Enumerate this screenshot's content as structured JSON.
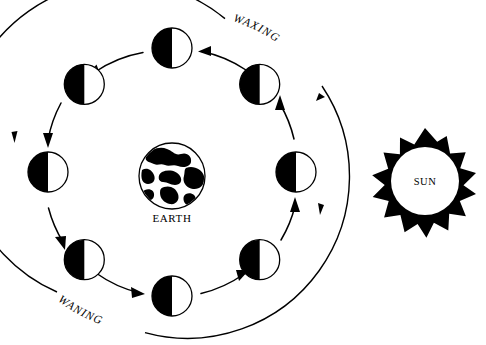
{
  "diagram": {
    "background_color": "#ffffff",
    "ink_color": "#000000",
    "width": 486,
    "height": 345
  },
  "labels": {
    "waxing": "WAXING",
    "waning": "WANING",
    "earth": "EARTH",
    "sun": "SUN"
  },
  "earth": {
    "label": "EARTH",
    "center_x": 172,
    "center_y": 176,
    "radius": 33
  },
  "sun": {
    "label": "SUN",
    "center_x": 425,
    "center_y": 180,
    "core_radius": 33,
    "ray_radius": 52,
    "ray_count": 14
  },
  "orbit": {
    "center_x": 172,
    "center_y": 172,
    "outer_radius": 162,
    "moon_orbit_radius": 124,
    "moon_radius": 20
  },
  "moons": [
    {
      "name": "moon-top",
      "angle_deg": 270,
      "dark_side": "left",
      "illuminated_fraction": 0.5
    },
    {
      "name": "moon-upper-right",
      "angle_deg": 315,
      "dark_side": "left",
      "illuminated_fraction": 0.5
    },
    {
      "name": "moon-right",
      "angle_deg": 0,
      "dark_side": "left",
      "illuminated_fraction": 0.5
    },
    {
      "name": "moon-lower-right",
      "angle_deg": 45,
      "dark_side": "left",
      "illuminated_fraction": 0.5
    },
    {
      "name": "moon-bottom",
      "angle_deg": 90,
      "dark_side": "left",
      "illuminated_fraction": 0.5
    },
    {
      "name": "moon-lower-left",
      "angle_deg": 135,
      "dark_side": "left",
      "illuminated_fraction": 0.5
    },
    {
      "name": "moon-left",
      "angle_deg": 180,
      "dark_side": "left",
      "illuminated_fraction": 0.5
    },
    {
      "name": "moon-upper-left",
      "angle_deg": 225,
      "dark_side": "left",
      "illuminated_fraction": 0.5
    }
  ],
  "arrows": {
    "direction": "counterclockwise",
    "outer_arrow_count": 3,
    "inner_arrow_count": 8
  }
}
